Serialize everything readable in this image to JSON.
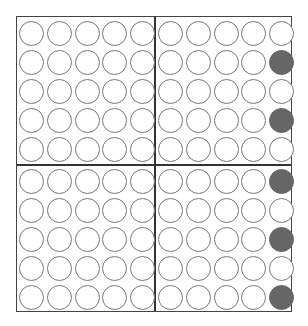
{
  "grid": {
    "rows": 10,
    "cols": 10,
    "quadrant_size": 5,
    "filled_color": "#666666",
    "empty_color": "#ffffff",
    "outline_color": "#777777",
    "filled_cells": [
      [
        1,
        9
      ],
      [
        3,
        9
      ],
      [
        5,
        9
      ],
      [
        7,
        9
      ],
      [
        9,
        9
      ]
    ]
  }
}
